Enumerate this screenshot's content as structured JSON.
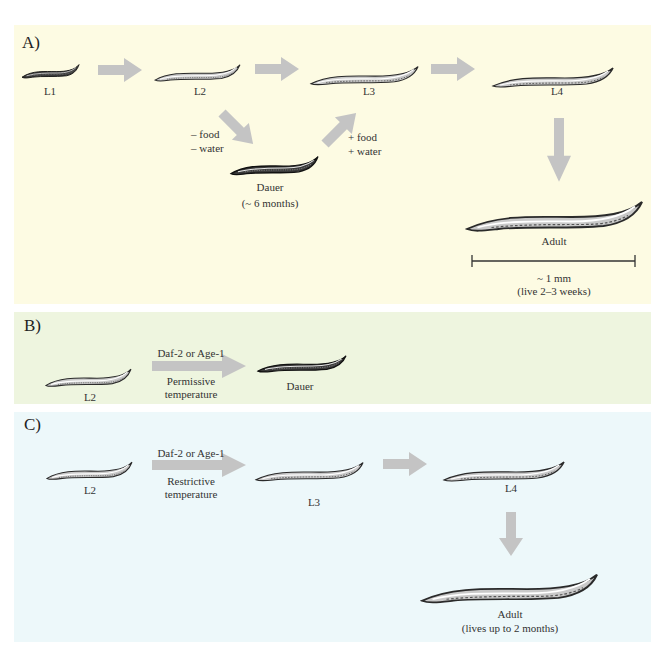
{
  "colors": {
    "panel_a_bg": "#fdfbe3",
    "panel_b_bg": "#eef5df",
    "panel_c_bg": "#edf8fa",
    "arrow": "#c4c4c4",
    "worm_outline": "#2a2a2a",
    "worm_fill": "#c9c9c9"
  },
  "panel_a": {
    "label": "A)",
    "stages": {
      "l1": "L1",
      "l2": "L2",
      "l3": "L3",
      "l4": "L4",
      "dauer": "Dauer",
      "dauer_duration": "(~ 6 months)",
      "adult": "Adult"
    },
    "conditions": {
      "to_dauer_line1": "– food",
      "to_dauer_line2": "– water",
      "from_dauer_line1": "+ food",
      "from_dauer_line2": "+ water"
    },
    "scale_bar": {
      "length_label": "~ 1 mm",
      "lifespan_label": "(live  2–3 weeks)"
    }
  },
  "panel_b": {
    "label": "B)",
    "start_stage": "L2",
    "arrow_top": "Daf-2 or Age-1",
    "arrow_bottom_line1": "Permissive",
    "arrow_bottom_line2": "temperature",
    "end_stage": "Dauer"
  },
  "panel_c": {
    "label": "C)",
    "start_stage": "L2",
    "arrow_top": "Daf-2 or Age-1",
    "arrow_bottom_line1": "Restrictive",
    "arrow_bottom_line2": "temperature",
    "stage_l3": "L3",
    "stage_l4": "L4",
    "adult": "Adult",
    "adult_lifespan": "(lives up to 2 months)"
  }
}
